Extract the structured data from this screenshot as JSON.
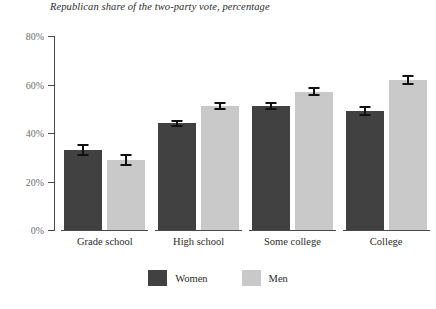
{
  "chart_data": {
    "type": "bar",
    "title": "Republican share of the two-party vote, percentage",
    "xlabel": "",
    "ylabel": "",
    "ylim": [
      0,
      80
    ],
    "yticks": [
      0,
      20,
      40,
      60,
      80
    ],
    "ytick_labels": [
      "0%",
      "20%",
      "40%",
      "60%",
      "80%"
    ],
    "grid": false,
    "legend_position": "bottom-center",
    "categories": [
      "Grade school",
      "High school",
      "Some college",
      "College"
    ],
    "series": [
      {
        "name": "Women",
        "color": "#414141",
        "values": [
          33,
          44,
          51,
          49
        ],
        "errors": [
          2.5,
          1.5,
          1.7,
          2.0
        ]
      },
      {
        "name": "Men",
        "color": "#c9c9c9",
        "values": [
          29,
          51,
          57,
          62
        ],
        "errors": [
          2.5,
          1.6,
          1.8,
          2.0
        ]
      }
    ]
  },
  "axis": {
    "line_color": "#4a4a4a",
    "label_color": "#6d6d6d"
  },
  "errorbar": {
    "color": "#111111"
  }
}
